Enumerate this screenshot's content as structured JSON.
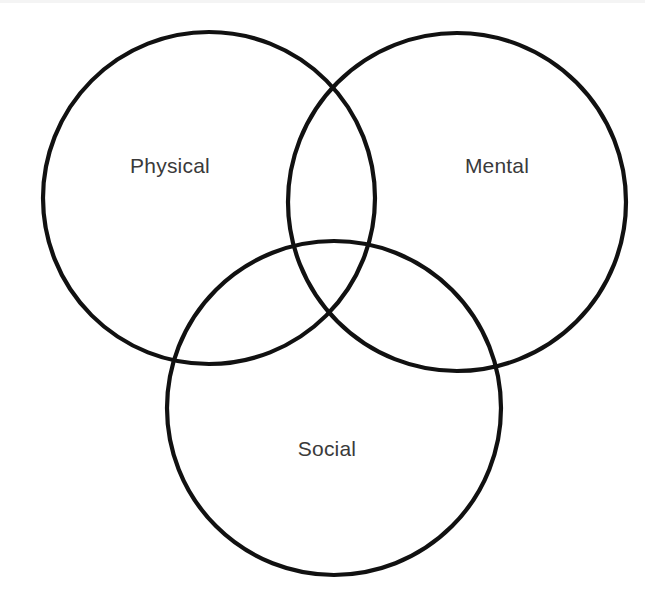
{
  "diagram": {
    "type": "venn",
    "title": "",
    "background_color": "#ffffff",
    "stroke_color": "#111111",
    "stroke_width": 4.2,
    "label_color": "#3a3a3a",
    "canvas": {
      "width": 645,
      "height": 608
    },
    "sets": [
      {
        "id": "physical",
        "label": "Physical",
        "center_x": 209,
        "center_y": 198,
        "radius": 166,
        "label_x": 170,
        "label_y": 167
      },
      {
        "id": "mental",
        "label": "Mental",
        "center_x": 457,
        "center_y": 202,
        "radius": 169,
        "label_x": 497,
        "label_y": 167
      },
      {
        "id": "social",
        "label": "Social",
        "center_x": 334,
        "center_y": 408,
        "radius": 167,
        "label_x": 327,
        "label_y": 450
      }
    ]
  }
}
